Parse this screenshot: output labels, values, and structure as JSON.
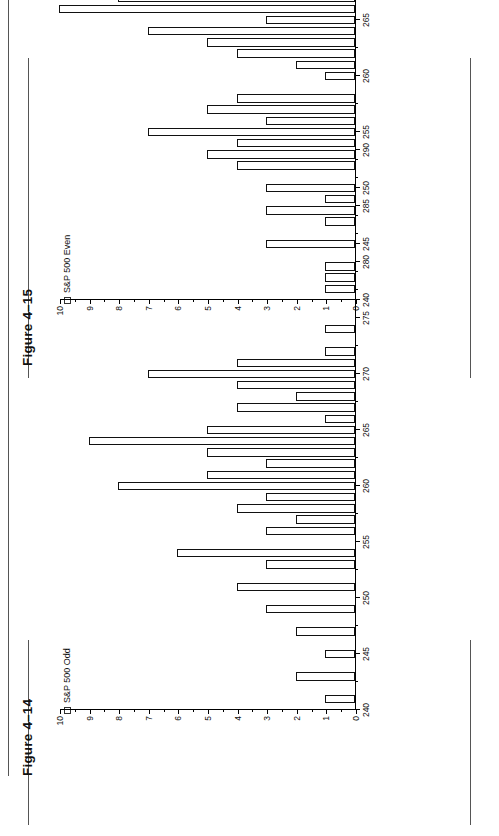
{
  "page": {
    "background": "#ffffff",
    "ink_color": "#111111"
  },
  "figures": [
    {
      "id": "fig-4-15",
      "title": "Figure 4–15",
      "legend_label": "S&P 500 Even",
      "legend_marker": "square-outline-icon"
    },
    {
      "id": "fig-4-14",
      "title": "Figure 4–14",
      "legend_label": "S&P 500 Odd",
      "legend_marker": "square-outline-icon"
    }
  ],
  "axis": {
    "value_ticks": [
      "0",
      "1",
      "2",
      "3",
      "4",
      "5",
      "6",
      "7",
      "8",
      "9",
      "10"
    ],
    "category_ticks": [
      "240",
      "245",
      "250",
      "255",
      "260",
      "265",
      "270",
      "275",
      "280",
      "285",
      "290"
    ]
  },
  "chart_data": [
    {
      "id": "fig-4-14",
      "type": "bar",
      "title": "Figure 4–14",
      "xlabel": "",
      "ylabel": "",
      "grid": false,
      "legend_position": "top-left",
      "series": [
        {
          "name": "S&P 500 Odd",
          "values": [
            0,
            1,
            0,
            2,
            0,
            1,
            0,
            2,
            0,
            3,
            0,
            4,
            0,
            3,
            6,
            0,
            3,
            2,
            4,
            3,
            8,
            5,
            3,
            5,
            9,
            5,
            1,
            4,
            2,
            4,
            7,
            4,
            1,
            0,
            1,
            0,
            0,
            0,
            0,
            0,
            0,
            0,
            0,
            0,
            0,
            0,
            0,
            0,
            0,
            0,
            0
          ]
        }
      ],
      "categories": [
        240,
        241,
        242,
        243,
        244,
        245,
        246,
        247,
        248,
        249,
        250,
        251,
        252,
        253,
        254,
        255,
        256,
        257,
        258,
        259,
        260,
        261,
        262,
        263,
        264,
        265,
        266,
        267,
        268,
        269,
        270,
        271,
        272,
        273,
        274,
        275,
        276,
        277,
        278,
        279,
        280,
        281,
        282,
        283,
        284,
        285,
        286,
        287,
        288,
        289,
        290
      ],
      "xlim": [
        240,
        290
      ],
      "ylim": [
        0,
        10
      ]
    },
    {
      "id": "fig-4-15",
      "type": "bar",
      "title": "Figure 4–15",
      "xlabel": "",
      "ylabel": "",
      "grid": false,
      "legend_position": "top-left",
      "series": [
        {
          "name": "S&P 500 Even",
          "values": [
            0,
            1,
            1,
            1,
            0,
            3,
            0,
            1,
            3,
            1,
            3,
            0,
            4,
            5,
            4,
            7,
            3,
            5,
            4,
            0,
            1,
            2,
            4,
            5,
            7,
            3,
            10,
            8,
            6,
            5,
            1,
            4,
            5,
            2,
            4,
            0,
            1,
            2,
            0,
            0,
            0,
            0,
            0,
            0,
            0,
            0,
            0,
            0,
            0,
            0,
            0
          ]
        }
      ],
      "categories": [
        240,
        241,
        242,
        243,
        244,
        245,
        246,
        247,
        248,
        249,
        250,
        251,
        252,
        253,
        254,
        255,
        256,
        257,
        258,
        259,
        260,
        261,
        262,
        263,
        264,
        265,
        266,
        267,
        268,
        269,
        270,
        271,
        272,
        273,
        274,
        275,
        276,
        277,
        278,
        279,
        280,
        281,
        282,
        283,
        284,
        285,
        286,
        287,
        288,
        289,
        290
      ],
      "xlim": [
        240,
        290
      ],
      "ylim": [
        0,
        10
      ]
    }
  ]
}
